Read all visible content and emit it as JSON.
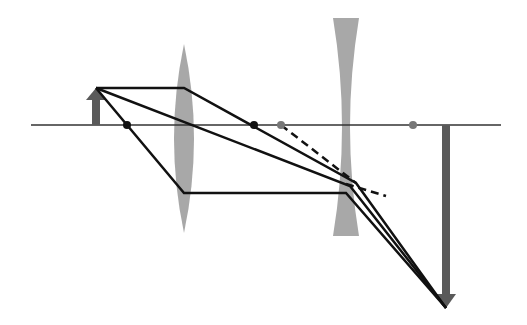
{
  "diagram": {
    "type": "two-lens ray diagram (converging + diverging)",
    "colors": {
      "background": "#ffffff",
      "ray": "#111111",
      "axis": "#333333",
      "lens": "#a8a8a8",
      "object_arrow": "#5a5a5a",
      "image_arrow": "#5a5a5a",
      "focal_point_converging": "#111111",
      "focal_point_diverging": "#777777"
    },
    "optical_axis": {
      "y": 125,
      "x1": 31,
      "x2": 501
    },
    "converging_lens": {
      "x": 184,
      "top": 44,
      "bottom": 233,
      "half_width": 10
    },
    "diverging_lens": {
      "x": 346,
      "top": 18,
      "bottom": 236,
      "half_width_edge": 13,
      "half_width_center": 4
    },
    "object_arrow": {
      "x": 96,
      "base_y": 125,
      "tip_y": 88
    },
    "image_arrow": {
      "x": 446,
      "base_y": 125,
      "tip_y": 308
    },
    "focal_points": [
      {
        "label": "F1-left",
        "x": 127,
        "y": 125,
        "kind": "converging"
      },
      {
        "label": "F1-right",
        "x": 254,
        "y": 125,
        "kind": "converging"
      },
      {
        "label": "F2-left",
        "x": 281,
        "y": 125,
        "kind": "diverging"
      },
      {
        "label": "F2-right",
        "x": 413,
        "y": 125,
        "kind": "diverging"
      }
    ],
    "rays": [
      {
        "name": "parallel-ray",
        "points": [
          [
            96,
            88
          ],
          [
            184,
            88
          ],
          [
            356,
            183
          ],
          [
            446,
            308
          ]
        ]
      },
      {
        "name": "central-ray",
        "points": [
          [
            96,
            88
          ],
          [
            350,
            186
          ],
          [
            446,
            308
          ]
        ]
      },
      {
        "name": "focal-ray",
        "points": [
          [
            96,
            88
          ],
          [
            184,
            193
          ],
          [
            346,
            193
          ],
          [
            446,
            308
          ]
        ]
      }
    ],
    "dashed_rays": [
      {
        "name": "virtual-extension-1",
        "points": [
          [
            281,
            125
          ],
          [
            356,
            183
          ]
        ]
      },
      {
        "name": "virtual-extension-2",
        "points": [
          [
            346,
            184
          ],
          [
            386,
            196
          ]
        ]
      }
    ]
  }
}
